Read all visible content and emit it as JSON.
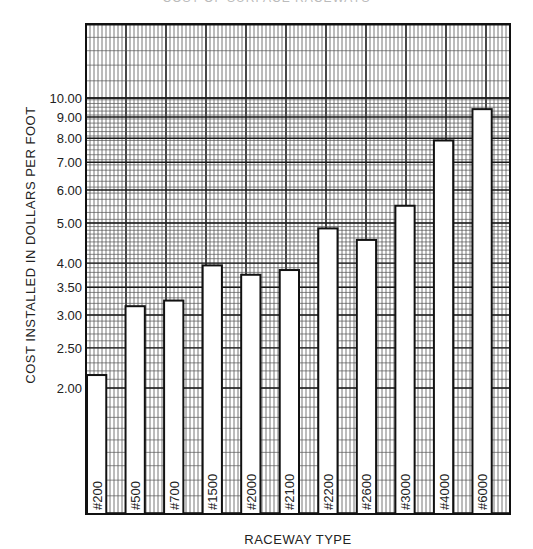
{
  "chart_data": {
    "type": "bar",
    "title": "COST OF SURFACE RACEWAYS",
    "xlabel": "RACEWAY TYPE",
    "ylabel": "COST INSTALLED IN DOLLARS PER FOOT",
    "yscale": "log",
    "ylim": [
      1.0,
      20.0
    ],
    "grid": true,
    "legend": null,
    "yticks": [
      2.0,
      2.5,
      3.0,
      3.5,
      4.0,
      5.0,
      6.0,
      7.0,
      8.0,
      9.0,
      10.0
    ],
    "ytick_labels": [
      "2.00",
      "2.50",
      "3.00",
      "3.50",
      "4.00",
      "5.00",
      "6.00",
      "7.00",
      "8.00",
      "9.00",
      "10.00"
    ],
    "categories": [
      "#200",
      "#500",
      "#700",
      "#1500",
      "#2000",
      "#2100",
      "#2200",
      "#2600",
      "#3000",
      "#4000",
      "#6000"
    ],
    "values": [
      2.15,
      3.15,
      3.25,
      3.95,
      3.75,
      3.85,
      4.85,
      4.55,
      5.5,
      7.9,
      9.4
    ]
  },
  "colors": {
    "grid_major": "#1a1a1a",
    "grid_minor": "#555555",
    "bar_fill": "#ffffff",
    "bar_stroke": "#111111",
    "text": "#222222"
  }
}
